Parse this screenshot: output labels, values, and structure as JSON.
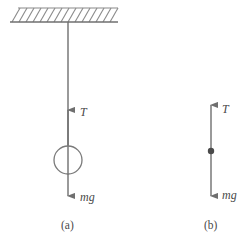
{
  "figure": {
    "background_color": "#ffffff",
    "line_color": "#6f6f6f",
    "hatch_color": "#8a8a8a",
    "label_color": "#4a4a4a",
    "width": 247,
    "height": 238
  },
  "panels": [
    {
      "id": "a",
      "caption": "(a)",
      "caption_x": 68,
      "caption_y": 228,
      "description": "Mass hanging from a string attached to a hatched ceiling",
      "ceiling": {
        "name": "hatched-ceiling",
        "x_start": 10,
        "x_end": 118,
        "y_line": 22,
        "hatch_top": 8,
        "hatch_count": 15,
        "hatch_slant": "up-right"
      },
      "string": {
        "name": "string",
        "x": 68,
        "y_top": 22,
        "y_bottom": 197
      },
      "bob": {
        "name": "mass-circle",
        "cx": 68,
        "cy": 160,
        "r": 14
      },
      "forces": [
        {
          "name": "tension-arrow",
          "label": "T",
          "label_x": 80,
          "label_y": 116,
          "direction": "up",
          "x": 68,
          "tip_y": 110,
          "tail_y": 146
        },
        {
          "name": "weight-arrow",
          "label": "mg",
          "label_x": 80,
          "label_y": 200,
          "direction": "down",
          "x": 68,
          "tip_y": 197,
          "tail_y": 174
        }
      ]
    },
    {
      "id": "b",
      "caption": "(b)",
      "caption_x": 211,
      "caption_y": 228,
      "description": "Free-body diagram: point particle with tension up and weight down",
      "particle": {
        "name": "particle-dot",
        "cx": 211,
        "cy": 151,
        "r": 3.2
      },
      "axis": {
        "name": "force-axis",
        "x": 211,
        "y_top": 105,
        "y_bottom": 197
      },
      "forces": [
        {
          "name": "tension-arrow",
          "label": "T",
          "label_x": 222,
          "label_y": 113,
          "direction": "up",
          "x": 211,
          "tip_y": 105,
          "tail_y": 151
        },
        {
          "name": "weight-arrow",
          "label": "mg",
          "label_x": 222,
          "label_y": 198,
          "direction": "down",
          "x": 211,
          "tip_y": 197,
          "tail_y": 151
        }
      ]
    }
  ]
}
